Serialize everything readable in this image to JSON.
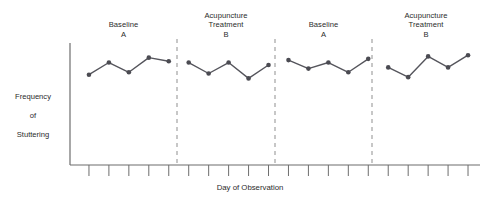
{
  "chart_data": {
    "type": "line",
    "title": "",
    "subtitle": "",
    "xlabel": "Day of Observation",
    "ylabel": "Frequency of Stuttering",
    "ylabel_lines": [
      "Frequency",
      "of",
      "Stuttering"
    ],
    "grid": false,
    "legend": "none",
    "axis": {
      "x_range_px": [
        70,
        480
      ],
      "y_range_px": [
        43,
        165
      ],
      "x_ticks_count": 20,
      "x_tick_labels": [],
      "y_tick_labels": [],
      "ylim": [
        0,
        10
      ],
      "xlim": [
        0.5,
        20.5
      ]
    },
    "marker": {
      "shape": "circle",
      "color": "#4b4b52",
      "size_px": 4.6
    },
    "line": {
      "color": "#55555c",
      "width_px": 1.4
    },
    "phases": [
      {
        "id": "phase-1",
        "label": "Baseline\nA",
        "label_lines": [
          "Baseline",
          "A"
        ],
        "condition": "Baseline",
        "condition_code": "A",
        "days": [
          1,
          2,
          3,
          4,
          5
        ],
        "values": [
          7.4,
          8.4,
          7.6,
          8.8,
          8.5
        ]
      },
      {
        "id": "phase-2",
        "label": "Acupuncture\nTreatment\nB",
        "label_lines": [
          "Acupuncture",
          "Treatment",
          "B"
        ],
        "condition": "Acupuncture Treatment",
        "condition_code": "B",
        "days": [
          6,
          7,
          8,
          9,
          10
        ],
        "values": [
          8.4,
          7.5,
          8.4,
          7.1,
          8.2
        ]
      },
      {
        "id": "phase-3",
        "label": "Baseline\nA",
        "label_lines": [
          "Baseline",
          "A"
        ],
        "condition": "Baseline",
        "condition_code": "A",
        "days": [
          11,
          12,
          13,
          14,
          15
        ],
        "values": [
          8.6,
          7.9,
          8.4,
          7.6,
          8.7
        ]
      },
      {
        "id": "phase-4",
        "label": "Acupuncture\nTreatment\nB",
        "label_lines": [
          "Acupuncture",
          "Treatment",
          "B"
        ],
        "condition": "Acupuncture Treatment",
        "condition_code": "B",
        "days": [
          16,
          17,
          18,
          19,
          20
        ],
        "values": [
          8.0,
          7.2,
          8.9,
          8.0,
          9.0
        ]
      }
    ],
    "phase_separators_px": [
      177,
      275,
      372
    ],
    "separator_style": {
      "dash": "4 4",
      "color": "#9a9a9a",
      "width_px": 1.1
    }
  },
  "colors": {
    "marker": "#4b4b52",
    "line": "#55555c",
    "axis": "#6d6d6d",
    "separator": "#9a9a9a",
    "text": "#2b2b2b",
    "background": "#ffffff"
  }
}
